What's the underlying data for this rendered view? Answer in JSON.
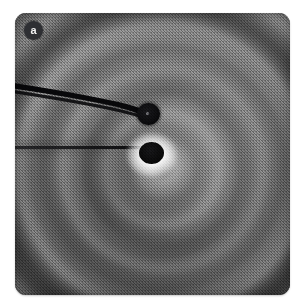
{
  "figure": {
    "panel_label": "a",
    "caption": "",
    "type": "micrograph"
  },
  "panel": {
    "x": 15,
    "y": 13,
    "width": 275,
    "height": 282,
    "corner_radius": 11
  },
  "colors": {
    "background": "#ffffff",
    "plate_mid_gray": "#6f6f6f",
    "plate_light_band": "#8a8a8a",
    "plate_dark_band": "#565656",
    "particle_black": "#000000",
    "halo_white": "#ffffff",
    "badge_fill": "#2e2f33",
    "badge_text": "#f2f2f2"
  },
  "features": {
    "probe": {
      "name": "cantilever-probe",
      "entry_point": [
        0,
        76
      ],
      "tip_point": [
        133,
        101
      ],
      "stroke_color": "#0a0a0c"
    },
    "particles": [
      {
        "name": "upper-particle",
        "cx": 133,
        "cy": 101,
        "rx": 11.5,
        "ry": 11,
        "has_halo": false
      },
      {
        "name": "lower-particle",
        "cx": 136,
        "cy": 140,
        "rx": 12.5,
        "ry": 11,
        "has_halo": true
      }
    ],
    "filament": {
      "name": "horizontal-filament",
      "from": [
        0,
        134
      ],
      "to": [
        132,
        134
      ]
    },
    "ring_system": {
      "center": [
        141,
        148
      ],
      "approx_fringe_spacing_px": 22,
      "visible_ring_count": 9
    }
  }
}
